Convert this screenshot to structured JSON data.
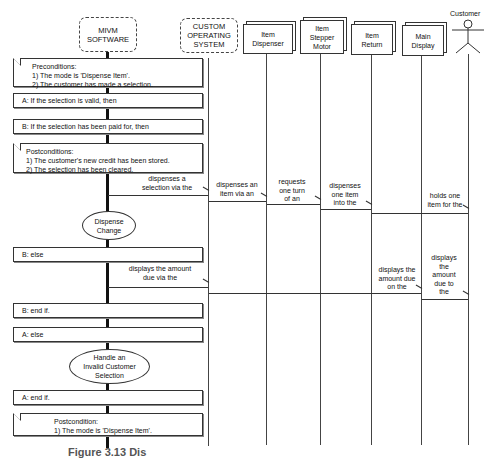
{
  "lifelines": [
    {
      "id": "mivm",
      "label": "MIVM\nSOFTWARE",
      "lines": [
        "MIVM",
        "SOFTWARE"
      ],
      "style": "dashed-rounded"
    },
    {
      "id": "os",
      "label": "CUSTOM OPERATING SYSTEM",
      "lines": [
        "CUSTOM",
        "OPERATING",
        "SYSTEM"
      ],
      "style": "dashed-rounded"
    },
    {
      "id": "dispenser",
      "label": "Item Dispenser",
      "lines": [
        "Item",
        "Dispenser"
      ],
      "style": "3d-box"
    },
    {
      "id": "stepper",
      "label": "Item Stepper Motor",
      "lines": [
        "Item",
        "Stepper",
        "Motor"
      ],
      "style": "3d-box"
    },
    {
      "id": "return",
      "label": "Item Return",
      "lines": [
        "Item",
        "Return"
      ],
      "style": "3d-box"
    },
    {
      "id": "display",
      "label": "Main Display",
      "lines": [
        "Main",
        "Display"
      ],
      "style": "3d-box"
    },
    {
      "id": "customer",
      "label": "Customer",
      "lines": [
        "Customer"
      ],
      "style": "actor"
    }
  ],
  "notes": {
    "preconditions": {
      "title": "Preconditions:",
      "items": [
        "1) The mode is 'Dispense Item'.",
        "2) The customer has made a selection."
      ]
    },
    "postconditions": {
      "title": "Postconditions:",
      "items": [
        "1) The customer's new credit has been stored.",
        "2) The selection has been cleared."
      ]
    },
    "postcondition_final": {
      "title": "Postcondition:",
      "items": [
        "1) The mode is 'Dispense Item'."
      ]
    }
  },
  "frames": {
    "a_if": "A: If the selection is valid, then",
    "b_if": "B: If the selection has been paid for, then",
    "b_else": "B: else",
    "b_endif": "B: end if.",
    "a_else": "A: else",
    "a_endif": "A: end if."
  },
  "use_cases": {
    "dispense_change": [
      "Dispense",
      "Change"
    ],
    "handle_invalid": [
      "Handle an",
      "Invalid Customer",
      "Selection"
    ]
  },
  "messages": [
    {
      "from": "mivm",
      "to": "os",
      "lines": [
        "dispenses a",
        "selection via the"
      ]
    },
    {
      "from": "os",
      "to": "dispenser",
      "lines": [
        "dispenses an",
        "item via an"
      ]
    },
    {
      "from": "dispenser",
      "to": "stepper",
      "lines": [
        "requests",
        "one turn",
        "of an"
      ]
    },
    {
      "from": "stepper",
      "to": "return",
      "lines": [
        "dispenses",
        "one item",
        "into the"
      ]
    },
    {
      "from": "return",
      "to": "customer",
      "lines": [
        "holds one",
        "item for the"
      ]
    },
    {
      "from": "mivm",
      "to": "os",
      "lines": [
        "displays the amount",
        "due via the"
      ]
    },
    {
      "from": "os",
      "to": "display",
      "lines": [
        "displays the",
        "amount due",
        "on the"
      ]
    },
    {
      "from": "display",
      "to": "customer",
      "lines": [
        "displays",
        "the",
        "amount",
        "due to",
        "the"
      ]
    }
  ],
  "caption": "Figure 3.13 Dis"
}
